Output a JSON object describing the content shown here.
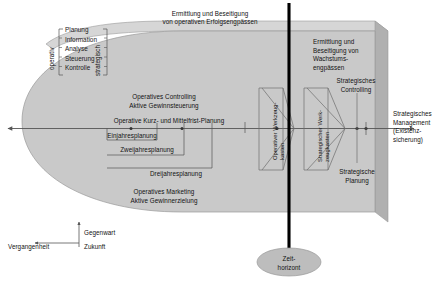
{
  "diagram": {
    "title_top": "Ermittlung und Beseitigung\nvon operativen Erfolgsengpässen",
    "axis_labels": {
      "operativ": "operativ",
      "strategisch": "strategisch"
    },
    "function_list": [
      "Planung",
      "Information",
      "Analyse",
      "Steuerung",
      "Kontrolle"
    ],
    "operative_block": {
      "controlling_line1": "Operatives Controlling",
      "controlling_line2": "Aktive Gewinnsteuerung",
      "planning_axis_label": "Operative Kurz- und Mittelfrist-Planung",
      "horizon_1": "Einjahresplanung",
      "horizon_2": "Zweijahresplanung",
      "horizon_3": "Dreijahresplanung",
      "marketing_line1": "Operatives Marketing",
      "marketing_line2": "Aktive Gewinnerzielung"
    },
    "toolboxes": {
      "operative": "Operativer Werkzeug-\nkasten",
      "operative_line1": "Operativer Werkzeug-",
      "operative_line2": "kasten",
      "strategic_line1": "Strategischer Werk-",
      "strategic_line2": "zeugkasten"
    },
    "strategic_block": {
      "engpass_line1": "Ermittlung und",
      "engpass_line2": "Beseitigung von",
      "engpass_line3": "Wachstums-",
      "engpass_line4": "engpässen",
      "controlling_line1": "Strategisches",
      "controlling_line2": "Controlling",
      "planung_line1": "Strategische",
      "planung_line2": "Planung"
    },
    "right_label": {
      "line1": "Strategisches",
      "line2": "Management",
      "line3": "(Existenz-",
      "line4": "sicherung)"
    },
    "time_axis": {
      "gegenwart": "Gegenwart",
      "vergangenheit": "Vergangenheit",
      "zukunft": "Zukunft"
    },
    "time_horizon": {
      "line1": "Zeit-",
      "line2": "horizont"
    },
    "colors": {
      "slab_fill": "#c8c8c8",
      "slab_top": "#d8d8d8",
      "slab_side": "#b4b4b4",
      "line": "#555555",
      "black": "#000000",
      "ellipse": "#b9b9b9"
    }
  }
}
